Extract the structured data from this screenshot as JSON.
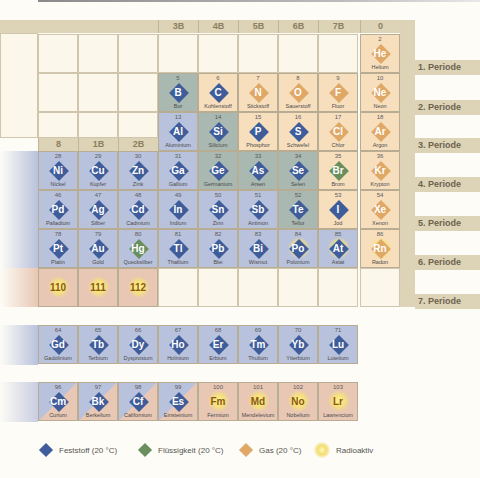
{
  "headers": {
    "top": [
      {
        "label": "3B",
        "x": 158
      },
      {
        "label": "4B",
        "x": 198
      },
      {
        "label": "5B",
        "x": 238
      },
      {
        "label": "6B",
        "x": 278
      },
      {
        "label": "7B",
        "x": 318
      },
      {
        "label": "0",
        "x": 360
      }
    ],
    "mid": [
      {
        "label": "8",
        "x": 38
      },
      {
        "label": "1B",
        "x": 78
      },
      {
        "label": "2B",
        "x": 118
      }
    ]
  },
  "periods": [
    {
      "label": "1. Periode"
    },
    {
      "label": "2. Periode"
    },
    {
      "label": "3. Periode"
    },
    {
      "label": "4. Periode"
    },
    {
      "label": "5. Periode"
    },
    {
      "label": "6. Periode"
    },
    {
      "label": "7. Periode"
    }
  ],
  "colors": {
    "solid": "#3f5d9a",
    "liquid": "#6a8f5e",
    "gas": "#e0a866",
    "radioactive": "#f3dc70"
  },
  "elements": [
    {
      "n": "2",
      "s": "He",
      "name": "Helium",
      "state": "gas",
      "bg": "gas",
      "col": 8,
      "row": 1
    },
    {
      "n": "5",
      "s": "B",
      "name": "Bor",
      "state": "solid",
      "bg": "metalloid",
      "col": 3,
      "row": 2
    },
    {
      "n": "6",
      "s": "C",
      "name": "Kohlenstoff",
      "state": "solid",
      "bg": "gas",
      "col": 4,
      "row": 2
    },
    {
      "n": "7",
      "s": "N",
      "name": "Stickstoff",
      "state": "gas",
      "bg": "gas",
      "col": 5,
      "row": 2
    },
    {
      "n": "8",
      "s": "O",
      "name": "Sauerstoff",
      "state": "gas",
      "bg": "gas",
      "col": 6,
      "row": 2
    },
    {
      "n": "9",
      "s": "F",
      "name": "Fluor",
      "state": "gas",
      "bg": "gas",
      "col": 7,
      "row": 2
    },
    {
      "n": "10",
      "s": "Ne",
      "name": "Neon",
      "state": "gas",
      "bg": "gas",
      "col": 8,
      "row": 2
    },
    {
      "n": "13",
      "s": "Al",
      "name": "Aluminium",
      "state": "solid",
      "bg": "solid",
      "col": 3,
      "row": 3
    },
    {
      "n": "14",
      "s": "Si",
      "name": "Silicium",
      "state": "solid",
      "bg": "metalloid",
      "col": 4,
      "row": 3
    },
    {
      "n": "15",
      "s": "P",
      "name": "Phosphor",
      "state": "solid",
      "bg": "gas",
      "col": 5,
      "row": 3
    },
    {
      "n": "16",
      "s": "S",
      "name": "Schwefel",
      "state": "solid",
      "bg": "gas",
      "col": 6,
      "row": 3
    },
    {
      "n": "17",
      "s": "Cl",
      "name": "Chlor",
      "state": "gas",
      "bg": "gas",
      "col": 7,
      "row": 3
    },
    {
      "n": "18",
      "s": "Ar",
      "name": "Argon",
      "state": "gas",
      "bg": "gas",
      "col": 8,
      "row": 3
    },
    {
      "n": "28",
      "s": "Ni",
      "name": "Nickel",
      "state": "solid",
      "bg": "solid",
      "col": 0,
      "row": 4
    },
    {
      "n": "29",
      "s": "Cu",
      "name": "Kupfer",
      "state": "solid",
      "bg": "solid",
      "col": 1,
      "row": 4
    },
    {
      "n": "30",
      "s": "Zn",
      "name": "Zink",
      "state": "solid",
      "bg": "solid",
      "col": 2,
      "row": 4
    },
    {
      "n": "31",
      "s": "Ga",
      "name": "Gallium",
      "state": "solid",
      "bg": "solid",
      "col": 3,
      "row": 4
    },
    {
      "n": "32",
      "s": "Ge",
      "name": "Germanium",
      "state": "solid",
      "bg": "metalloid",
      "col": 4,
      "row": 4
    },
    {
      "n": "33",
      "s": "As",
      "name": "Arsen",
      "state": "solid",
      "bg": "metalloid",
      "col": 5,
      "row": 4
    },
    {
      "n": "34",
      "s": "Se",
      "name": "Selen",
      "state": "solid",
      "bg": "metalloid",
      "col": 6,
      "row": 4
    },
    {
      "n": "35",
      "s": "Br",
      "name": "Brom",
      "state": "liquid",
      "bg": "gas",
      "col": 7,
      "row": 4
    },
    {
      "n": "36",
      "s": "Kr",
      "name": "Krypton",
      "state": "gas",
      "bg": "gas",
      "col": 8,
      "row": 4
    },
    {
      "n": "46",
      "s": "Pd",
      "name": "Palladium",
      "state": "solid",
      "bg": "solid",
      "col": 0,
      "row": 5
    },
    {
      "n": "47",
      "s": "Ag",
      "name": "Silber",
      "state": "solid",
      "bg": "solid",
      "col": 1,
      "row": 5
    },
    {
      "n": "48",
      "s": "Cd",
      "name": "Cadmium",
      "state": "solid",
      "bg": "solid",
      "col": 2,
      "row": 5
    },
    {
      "n": "49",
      "s": "In",
      "name": "Indium",
      "state": "solid",
      "bg": "solid",
      "col": 3,
      "row": 5
    },
    {
      "n": "50",
      "s": "Sn",
      "name": "Zinn",
      "state": "solid",
      "bg": "solid",
      "col": 4,
      "row": 5
    },
    {
      "n": "51",
      "s": "Sb",
      "name": "Antimon",
      "state": "solid",
      "bg": "solid",
      "col": 5,
      "row": 5
    },
    {
      "n": "52",
      "s": "Te",
      "name": "Tellur",
      "state": "solid",
      "bg": "metalloid",
      "col": 6,
      "row": 5
    },
    {
      "n": "53",
      "s": "I",
      "name": "Jod",
      "state": "solid",
      "bg": "gas",
      "col": 7,
      "row": 5
    },
    {
      "n": "54",
      "s": "Xe",
      "name": "Xenon",
      "state": "gas",
      "bg": "gas",
      "col": 8,
      "row": 5
    },
    {
      "n": "78",
      "s": "Pt",
      "name": "Platin",
      "state": "solid",
      "bg": "solid",
      "col": 0,
      "row": 6
    },
    {
      "n": "79",
      "s": "Au",
      "name": "Gold",
      "state": "solid",
      "bg": "solid",
      "col": 1,
      "row": 6
    },
    {
      "n": "80",
      "s": "Hg",
      "name": "Quecksilber",
      "state": "liquid",
      "bg": "solid",
      "col": 2,
      "row": 6
    },
    {
      "n": "81",
      "s": "Tl",
      "name": "Thallium",
      "state": "solid",
      "bg": "solid",
      "col": 3,
      "row": 6
    },
    {
      "n": "82",
      "s": "Pb",
      "name": "Blei",
      "state": "solid",
      "bg": "solid",
      "col": 4,
      "row": 6
    },
    {
      "n": "83",
      "s": "Bi",
      "name": "Wismut",
      "state": "solid",
      "bg": "solid",
      "col": 5,
      "row": 6
    },
    {
      "n": "84",
      "s": "Po",
      "name": "Polonium",
      "state": "solid",
      "bg": "solid",
      "col": 6,
      "row": 6,
      "rad": true
    },
    {
      "n": "85",
      "s": "At",
      "name": "Astat",
      "state": "solid",
      "bg": "solid",
      "col": 7,
      "row": 6,
      "rad": true
    },
    {
      "n": "86",
      "s": "Rn",
      "name": "Radon",
      "state": "gas",
      "bg": "gas",
      "col": 8,
      "row": 6,
      "rad": true
    },
    {
      "n": "",
      "s": "110",
      "name": "",
      "state": "rad",
      "bg": "rad",
      "col": 0,
      "row": 7
    },
    {
      "n": "",
      "s": "111",
      "name": "",
      "state": "rad",
      "bg": "rad",
      "col": 1,
      "row": 7
    },
    {
      "n": "",
      "s": "112",
      "name": "",
      "state": "rad",
      "bg": "rad",
      "col": 2,
      "row": 7
    }
  ],
  "lanthanides": [
    {
      "n": "64",
      "s": "Gd",
      "name": "Gadolinium",
      "state": "solid",
      "bg": "solid"
    },
    {
      "n": "65",
      "s": "Tb",
      "name": "Terbium",
      "state": "solid",
      "bg": "solid"
    },
    {
      "n": "66",
      "s": "Dy",
      "name": "Dysprosium",
      "state": "solid",
      "bg": "solid"
    },
    {
      "n": "67",
      "s": "Ho",
      "name": "Holmium",
      "state": "solid",
      "bg": "solid"
    },
    {
      "n": "68",
      "s": "Er",
      "name": "Erbium",
      "state": "solid",
      "bg": "solid"
    },
    {
      "n": "69",
      "s": "Tm",
      "name": "Thulium",
      "state": "solid",
      "bg": "solid"
    },
    {
      "n": "70",
      "s": "Yb",
      "name": "Ytterbium",
      "state": "solid",
      "bg": "solid"
    },
    {
      "n": "71",
      "s": "Lu",
      "name": "Lutetium",
      "state": "solid",
      "bg": "solid"
    }
  ],
  "actinides": [
    {
      "n": "96",
      "s": "Cm",
      "name": "Curium",
      "state": "solid",
      "bg": "radsolid"
    },
    {
      "n": "97",
      "s": "Bk",
      "name": "Berkelium",
      "state": "solid",
      "bg": "radsolid"
    },
    {
      "n": "98",
      "s": "Cf",
      "name": "Californium",
      "state": "solid",
      "bg": "radsolid"
    },
    {
      "n": "99",
      "s": "Es",
      "name": "Einsteinium",
      "state": "solid",
      "bg": "radsolid"
    },
    {
      "n": "100",
      "s": "Fm",
      "name": "Fermium",
      "state": "rad",
      "bg": "rad"
    },
    {
      "n": "101",
      "s": "Md",
      "name": "Mendelevium",
      "state": "rad",
      "bg": "rad"
    },
    {
      "n": "102",
      "s": "No",
      "name": "Nobelium",
      "state": "rad",
      "bg": "rad"
    },
    {
      "n": "103",
      "s": "Lr",
      "name": "Lawrencium",
      "state": "rad",
      "bg": "rad"
    }
  ],
  "legend": [
    {
      "label": "Feststoff (20 °C)",
      "kind": "solid"
    },
    {
      "label": "Flüssigkeit (20 °C)",
      "kind": "liquid"
    },
    {
      "label": "Gas (20 °C)",
      "kind": "gas"
    },
    {
      "label": "Radioaktiv",
      "kind": "radioactive"
    }
  ]
}
